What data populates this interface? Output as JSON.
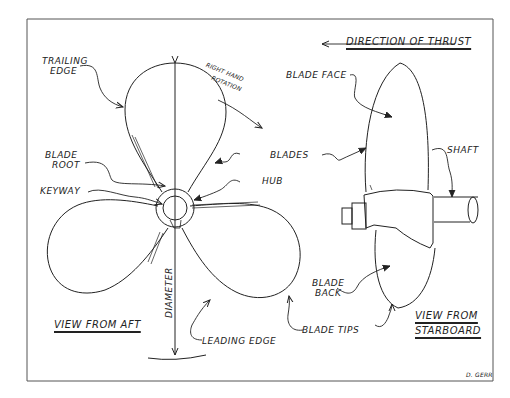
{
  "diagram": {
    "border_color": "#555555",
    "line_color": "#222222",
    "views": {
      "aft": {
        "title": "View From Aft"
      },
      "starboard": {
        "title_line1": "View From",
        "title_line2": "Starboard"
      }
    },
    "labels": {
      "trailing_edge_1": "Trailing",
      "trailing_edge_2": "Edge",
      "right_hand_rotation_1": "Right Hand",
      "right_hand_rotation_2": "Rotation",
      "blade_root_1": "Blade",
      "blade_root_2": "Root",
      "keyway": "Keyway",
      "blades": "Blades",
      "hub": "Hub",
      "diameter": "Diameter",
      "leading_edge": "Leading Edge",
      "blade_tips": "Blade Tips",
      "direction_of_thrust": "Direction Of Thrust",
      "blade_face": "Blade Face",
      "shaft": "Shaft",
      "blade_back_1": "Blade",
      "blade_back_2": "Back"
    },
    "signature": "D. Gerr"
  }
}
